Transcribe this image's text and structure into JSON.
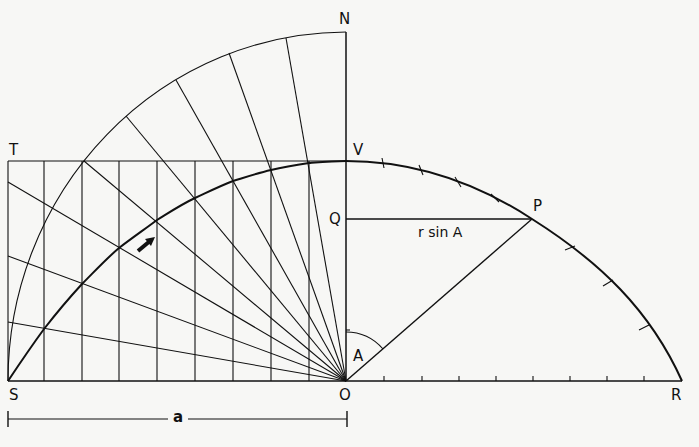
{
  "diagram": {
    "type": "geometric-construction",
    "labels": {
      "N": "N",
      "T": "T",
      "V": "V",
      "Q": "Q",
      "P": "P",
      "S": "S",
      "O": "O",
      "R": "R",
      "A": "A",
      "rsinA": "r sin A",
      "a": "a"
    },
    "points": {
      "O": [
        346,
        381
      ],
      "S": [
        8,
        381
      ],
      "R": [
        682,
        381
      ],
      "N": [
        346,
        32
      ],
      "T": [
        8,
        161
      ],
      "V": [
        346,
        161
      ],
      "Q": [
        346,
        219
      ],
      "P": [
        532,
        219
      ]
    },
    "radial_angles_deg": [
      10,
      20,
      30,
      40,
      50,
      60,
      70,
      80,
      90
    ],
    "vertical_grid_x": [
      8,
      44,
      82,
      119,
      157,
      195,
      233,
      271,
      309,
      346
    ],
    "left_curve_points": [
      [
        8,
        381
      ],
      [
        44,
        329
      ],
      [
        82,
        284
      ],
      [
        119,
        248
      ],
      [
        157,
        220
      ],
      [
        195,
        198
      ],
      [
        233,
        181
      ],
      [
        271,
        170
      ],
      [
        309,
        163
      ],
      [
        346,
        161
      ]
    ],
    "right_curve_ticks": [
      [
        383,
        163
      ],
      [
        421,
        170
      ],
      [
        458,
        182
      ],
      [
        495,
        198
      ],
      [
        570,
        248
      ],
      [
        608,
        283
      ],
      [
        644,
        327
      ]
    ],
    "baseline_ticks_x": [
      384,
      422,
      459,
      496,
      533,
      570,
      607,
      644
    ],
    "colors": {
      "ink": "#111111",
      "paper": "#f7f7f5"
    }
  }
}
